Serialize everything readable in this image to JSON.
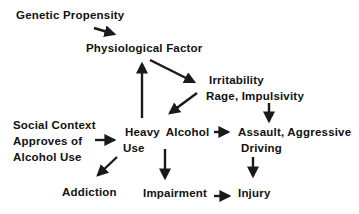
{
  "diagram": {
    "type": "causal-flow",
    "stroke_color": "#1a1a1a",
    "background": "#ffffff",
    "nodes": {
      "genetic": {
        "lines": [
          "Genetic Propensity"
        ]
      },
      "physio": {
        "lines": [
          "Physiological Factor"
        ]
      },
      "irritability": {
        "lines": [
          "Irritability",
          "Rage, Impulsivity"
        ]
      },
      "social": {
        "lines": [
          "Social Context",
          "Approves of",
          "Alcohol Use"
        ]
      },
      "heavy": {
        "lines": [
          "Heavy Alcohol",
          "Use"
        ]
      },
      "assault": {
        "lines": [
          "Assault, Aggressive",
          "Driving"
        ]
      },
      "addiction": {
        "lines": [
          "Addiction"
        ]
      },
      "impairment": {
        "lines": [
          "Impairment"
        ]
      },
      "injury": {
        "lines": [
          "Injury"
        ]
      }
    },
    "edges": [
      {
        "from": "Genetic Propensity",
        "to": "Physiological Factor"
      },
      {
        "from": "Physiological Factor",
        "to": "Irritability / Rage, Impulsivity"
      },
      {
        "from": "Irritability / Rage, Impulsivity",
        "to": "Heavy Alcohol Use"
      },
      {
        "from": "Heavy Alcohol Use",
        "to": "Physiological Factor"
      },
      {
        "from": "Irritability / Rage, Impulsivity",
        "to": "Assault, Aggressive Driving"
      },
      {
        "from": "Social Context Approves of Alcohol Use",
        "to": "Heavy Alcohol Use"
      },
      {
        "from": "Heavy Alcohol Use",
        "to": "Assault, Aggressive Driving"
      },
      {
        "from": "Heavy Alcohol Use",
        "to": "Addiction"
      },
      {
        "from": "Heavy Alcohol Use",
        "to": "Impairment"
      },
      {
        "from": "Assault, Aggressive Driving",
        "to": "Injury"
      },
      {
        "from": "Impairment",
        "to": "Injury"
      }
    ]
  }
}
